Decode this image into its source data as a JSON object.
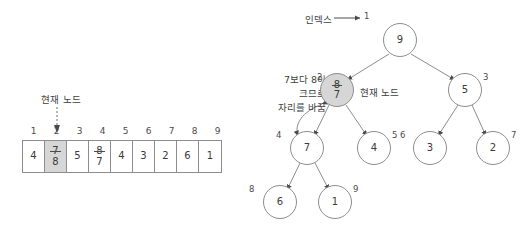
{
  "array": {
    "indices": [
      "1",
      "2",
      "3",
      "4",
      "5",
      "6",
      "7",
      "8",
      "9"
    ],
    "cells": [
      {
        "value": "4",
        "highlighted": false
      },
      {
        "old": "7",
        "new": "8",
        "highlighted": true
      },
      {
        "value": "5",
        "highlighted": false
      },
      {
        "old": "8",
        "new": "7",
        "highlighted": false
      },
      {
        "value": "4",
        "highlighted": false
      },
      {
        "value": "3",
        "highlighted": false
      },
      {
        "value": "2",
        "highlighted": false
      },
      {
        "value": "6",
        "highlighted": false
      },
      {
        "value": "1",
        "highlighted": false
      }
    ],
    "pointer_label": "현재 노드"
  },
  "tree": {
    "index_caption": "인덱스",
    "index_arrow_glyph": "→",
    "root_index": "1",
    "current_node_label": "현재 노드",
    "swap_note_lines": [
      "7보다 8이",
      "크므로",
      "자리를 바꿈"
    ],
    "nodes": [
      {
        "index": "1",
        "value": "9",
        "highlighted": false
      },
      {
        "index": "2",
        "old": "8",
        "new": "7",
        "highlighted": true
      },
      {
        "index": "3",
        "value": "5",
        "highlighted": false
      },
      {
        "index": "4",
        "value": "7",
        "highlighted": false
      },
      {
        "index": "5",
        "value": "4",
        "highlighted": false
      },
      {
        "index": "6",
        "value": "3",
        "highlighted": false
      },
      {
        "index": "7",
        "value": "2",
        "highlighted": false
      },
      {
        "index": "8",
        "value": "6",
        "highlighted": false
      },
      {
        "index": "9",
        "value": "1",
        "highlighted": false
      }
    ]
  },
  "colors": {
    "stroke": "#8d8d8d",
    "highlight_fill": "#d6d6d6",
    "text": "#3a3a3a",
    "background": "#ffffff"
  }
}
